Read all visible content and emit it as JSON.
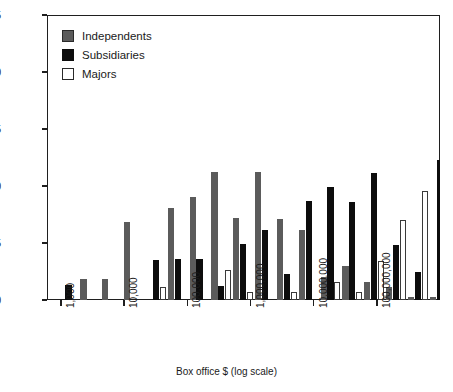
{
  "chart_data": {
    "type": "bar",
    "title": "",
    "xlabel": "Box office $ (log scale)",
    "ylabel": "Percent frequency",
    "ylim": [
      0,
      25
    ],
    "yticks": [
      0,
      5,
      10,
      15,
      20,
      25
    ],
    "grid": false,
    "legend_position": "top-left",
    "x_scale": "log",
    "xticks": [
      "1,000",
      "10,000",
      "100,000",
      "1,000,000",
      "10,000,000",
      "100,000,000"
    ],
    "xtick_values": [
      1000,
      10000,
      100000,
      1000000,
      10000000,
      100000000
    ],
    "categories": [
      "1,000",
      "2,200",
      "4,600",
      "10,000",
      "22,000",
      "46,000",
      "100,000",
      "220,000",
      "460,000",
      "1,000,000",
      "2,200,000",
      "4,600,000",
      "10,000,000",
      "22,000,000",
      "46,000,000",
      "100,000,000",
      "220,000,000",
      "460,000,000"
    ],
    "series": [
      {
        "name": "Independents",
        "color": "#5b5b5b",
        "values": [
          0,
          1.8,
          1.8,
          6.8,
          0,
          8.1,
          9.0,
          11.2,
          7.2,
          11.2,
          7.1,
          6.1,
          2.0,
          3.0,
          1.6,
          1.1,
          0.3,
          0.3
        ]
      },
      {
        "name": "Subsidiaries",
        "color": "#0d0d0d",
        "values": [
          1.3,
          0,
          0,
          0,
          3.5,
          3.6,
          3.6,
          1.2,
          4.9,
          6.1,
          2.3,
          8.7,
          9.9,
          8.6,
          11.1,
          4.8,
          2.5,
          12.3
        ]
      },
      {
        "name": "Majors",
        "color": "#ffffff",
        "values": [
          0,
          0,
          0,
          0,
          1.1,
          0,
          0,
          2.6,
          0.7,
          0,
          0.7,
          0,
          1.6,
          0.7,
          3.4,
          7.0,
          9.6,
          11.5
        ]
      }
    ],
    "bars": [
      {
        "series": "Independents",
        "x": 58,
        "value": 1.3
      },
      {
        "series": "Independents",
        "x": 85,
        "value": 1.8
      },
      {
        "series": "Independents",
        "x": 102,
        "value": 1.8
      },
      {
        "series": "Independents",
        "x": 126,
        "value": 6.8
      },
      {
        "series": "Independents",
        "x": 152,
        "value": 8.1
      },
      {
        "series": "Independents",
        "x": 166,
        "value": 9.0
      },
      {
        "series": "Independents",
        "x": 186,
        "value": 11.2
      },
      {
        "series": "Independents",
        "x": 204,
        "value": 7.2
      },
      {
        "series": "Independents",
        "x": 222,
        "value": 11.2
      },
      {
        "series": "Independents",
        "x": 240,
        "value": 10.6
      },
      {
        "series": "Independents",
        "x": 259,
        "value": 7.1
      },
      {
        "series": "Independents",
        "x": 277,
        "value": 6.1
      },
      {
        "series": "Independents",
        "x": 296,
        "value": 2.0
      },
      {
        "series": "Independents",
        "x": 314,
        "value": 3.0
      },
      {
        "series": "Independents",
        "x": 332,
        "value": 1.6
      },
      {
        "series": "Independents",
        "x": 352,
        "value": 1.1
      },
      {
        "series": "Independents",
        "x": 371,
        "value": 7.4
      },
      {
        "series": "Independents",
        "x": 389,
        "value": 0.3
      },
      {
        "series": "Independents",
        "x": 407,
        "value": 0.3
      },
      {
        "series": "Independents",
        "x": 425,
        "value": 0.3
      }
    ]
  },
  "legend": {
    "items": [
      {
        "label": "Independents",
        "key": "independents"
      },
      {
        "label": "Subsidiaries",
        "key": "subsidiaries"
      },
      {
        "label": "Majors",
        "key": "majors"
      }
    ]
  },
  "axes": {
    "y": {
      "title": "Percent frequency",
      "ticks": [
        "0",
        "5",
        "10",
        "15",
        "20",
        "25"
      ]
    },
    "x": {
      "title": "Box office $ (log scale)",
      "ticks": [
        "1,000",
        "10,000",
        "100,000",
        "1,000,000",
        "10,000,000",
        "100,000,000"
      ]
    }
  }
}
